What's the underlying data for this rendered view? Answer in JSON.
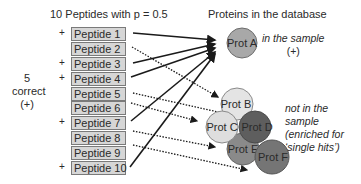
{
  "header": {
    "peptides_title": "10 Peptides with p = 0.5",
    "proteins_title": "Proteins in the database"
  },
  "side_label": {
    "count": "5",
    "word": "correct",
    "sign": "(+)"
  },
  "peptides": [
    {
      "label": "Peptide 1",
      "correct": "+"
    },
    {
      "label": "Peptide 2",
      "correct": ""
    },
    {
      "label": "Peptide 3",
      "correct": "+"
    },
    {
      "label": "Peptide 4",
      "correct": "+"
    },
    {
      "label": "Peptide 5",
      "correct": ""
    },
    {
      "label": "Peptide 6",
      "correct": ""
    },
    {
      "label": "Peptide 7",
      "correct": "+"
    },
    {
      "label": "Peptide 8",
      "correct": ""
    },
    {
      "label": "Peptide 9",
      "correct": ""
    },
    {
      "label": "Peptide 10",
      "correct": "+"
    }
  ],
  "proteins": {
    "a": {
      "label": "Prot A",
      "color": "#a8a8a8"
    },
    "b": {
      "label": "Prot B",
      "color": "#e4e4e4"
    },
    "c": {
      "label": "Prot C",
      "color": "#dedede"
    },
    "d": {
      "label": "Prot D",
      "color": "#5e5e5e"
    },
    "e": {
      "label": "Prot E",
      "color": "#8a8a8a"
    },
    "f": {
      "label": "Prot F",
      "color": "#757575"
    }
  },
  "notes": {
    "in_sample_line1": "in the sample",
    "in_sample_line2": "(+)",
    "not_in_sample": [
      "not in the",
      "sample",
      "(enriched for",
      "‘single hits’)"
    ]
  },
  "connections": {
    "solid_to_prot_a": [
      "Peptide 1",
      "Peptide 3",
      "Peptide 4",
      "Peptide 7",
      "Peptide 10"
    ],
    "dotted_to_cluster": [
      "Peptide 2",
      "Peptide 5",
      "Peptide 6",
      "Peptide 8",
      "Peptide 9"
    ]
  }
}
